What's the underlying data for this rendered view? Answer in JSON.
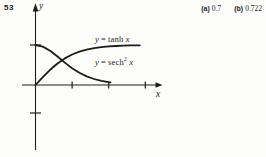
{
  "page": {
    "background": "#fdfdfc",
    "ink": "#1c1c1c"
  },
  "problem": {
    "number": "53"
  },
  "answers": [
    {
      "label": "(a)",
      "value": "0.7"
    },
    {
      "label": "(b)",
      "value": "0.722"
    }
  ],
  "axes": {
    "x_label": "x",
    "y_label": "y"
  },
  "curve_labels": [
    {
      "var": "y",
      "eq": "=",
      "func": "tanh",
      "sup": "",
      "arg": "x"
    },
    {
      "var": "y",
      "eq": "=",
      "func": "sech",
      "sup": "2",
      "arg": "x"
    }
  ],
  "chart_data": {
    "type": "line",
    "title": "",
    "xlabel": "x",
    "ylabel": "y",
    "xlim": [
      -0.4,
      3.5
    ],
    "ylim": [
      -1.7,
      2.0
    ],
    "grid": false,
    "legend": "inline-annotations",
    "x_ticks": [
      1,
      2,
      3
    ],
    "y_ticks": [
      1,
      -0.7
    ],
    "series": [
      {
        "name": "y = tanh x",
        "x": [
          0,
          0.2,
          0.4,
          0.6,
          0.8,
          1.0,
          1.2,
          1.4,
          1.6,
          1.8,
          2.0,
          2.2,
          2.4,
          2.6,
          2.85
        ],
        "y": [
          0,
          0.197,
          0.38,
          0.537,
          0.664,
          0.762,
          0.834,
          0.885,
          0.922,
          0.947,
          0.964,
          0.976,
          0.984,
          0.989,
          0.993
        ]
      },
      {
        "name": "y = sech^2 x",
        "x": [
          0,
          0.2,
          0.4,
          0.6,
          0.8,
          1.0,
          1.2,
          1.4,
          1.6,
          1.8,
          2.0,
          2.05
        ],
        "y": [
          1,
          0.961,
          0.856,
          0.712,
          0.559,
          0.42,
          0.305,
          0.216,
          0.15,
          0.104,
          0.071,
          0.066
        ]
      }
    ],
    "annotations": {
      "intersection_x": 0.722,
      "intersection_y": 0.617
    }
  }
}
